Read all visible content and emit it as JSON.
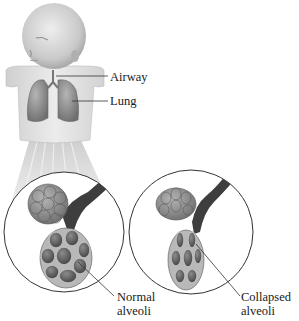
{
  "labels": {
    "airway": "Airway",
    "lung": "Lung",
    "normal": [
      "Normal",
      "alveoli"
    ],
    "collapsed": [
      "Collapsed",
      "alveoli"
    ]
  },
  "panels": [
    {
      "name": "normal-alveoli",
      "state": "inflated"
    },
    {
      "name": "collapsed-alveoli",
      "state": "collapsed"
    }
  ],
  "colors": {
    "skin": "#d9d9d9",
    "lung": "#8a8a8a",
    "alveoli": "#7d7d7d",
    "bronchus": "#3e3e3e",
    "outline": "#333333"
  }
}
